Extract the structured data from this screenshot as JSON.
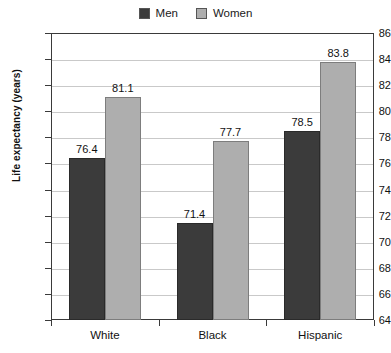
{
  "chart_data": {
    "type": "bar",
    "title": "",
    "subtitle": "",
    "xlabel": "",
    "ylabel": "Life expectancy (years)",
    "ylim": [
      64,
      86
    ],
    "ytick_step": 2,
    "ytick_labels": [
      "86",
      "84",
      "82",
      "80",
      "78",
      "76",
      "74",
      "72",
      "70",
      "68",
      "66",
      "64"
    ],
    "categories": [
      "White",
      "Black",
      "Hispanic"
    ],
    "grid": "horizontal",
    "legend_position": "top-center",
    "series": [
      {
        "name": "Men",
        "color": "#3b3b3b",
        "values": [
          76.4,
          71.4,
          78.5
        ],
        "labels": [
          "76.4",
          "71.4",
          "78.5"
        ]
      },
      {
        "name": "Women",
        "color": "#aeaeae",
        "values": [
          81.1,
          77.7,
          83.8
        ],
        "labels": [
          "81.1",
          "77.7",
          "83.8"
        ]
      }
    ]
  },
  "legend": {
    "items": [
      {
        "label": "Men",
        "swatch": "#3b3b3b"
      },
      {
        "label": "Women",
        "swatch": "#aeaeae"
      }
    ]
  }
}
